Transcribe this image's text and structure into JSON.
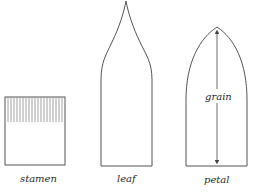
{
  "diagram": {
    "shapes": [
      {
        "name": "stamen",
        "label": "stamen"
      },
      {
        "name": "leaf",
        "label": "leaf"
      },
      {
        "name": "petal",
        "label": "petal",
        "annotation": "grain"
      }
    ],
    "colors": {
      "stroke": "#555555",
      "fringe": "#8a8a8a",
      "text": "#2a2a2a"
    }
  }
}
